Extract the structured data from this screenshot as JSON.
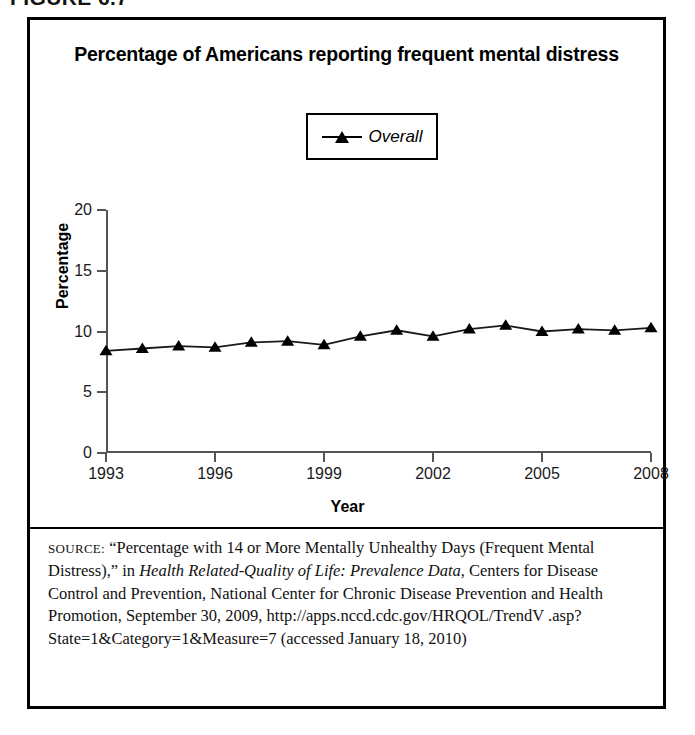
{
  "figure": {
    "label": "FIGURE 6.7"
  },
  "chart": {
    "title": "Percentage of Americans reporting frequent mental distress",
    "legend": {
      "position": "top-center",
      "entries": [
        {
          "label": "Overall",
          "marker": "triangle-up-marker",
          "color": "#000000"
        }
      ]
    }
  },
  "chart_data": {
    "type": "line",
    "title": "Percentage of Americans reporting frequent mental distress",
    "xlabel": "Year",
    "ylabel": "Percentage",
    "xlim": [
      1993,
      2008
    ],
    "ylim": [
      0,
      20
    ],
    "xticks": [
      1993,
      1996,
      1999,
      2002,
      2005,
      2008
    ],
    "yticks": [
      0,
      5,
      10,
      15,
      20
    ],
    "xtick_labels": [
      "1993",
      "1996",
      "1999",
      "2002",
      "2005",
      "2008"
    ],
    "ytick_labels": [
      "0",
      "5",
      "10",
      "15",
      "20"
    ],
    "grid": false,
    "legend_position": "top-center",
    "x": [
      1993,
      1994,
      1995,
      1996,
      1997,
      1998,
      1999,
      2000,
      2001,
      2002,
      2003,
      2004,
      2005,
      2006,
      2007,
      2008
    ],
    "series": [
      {
        "name": "Overall",
        "color": "#000000",
        "marker": "triangle-up-marker",
        "values": [
          8.4,
          8.6,
          8.8,
          8.7,
          9.1,
          9.2,
          8.9,
          9.6,
          10.1,
          9.6,
          10.2,
          10.5,
          10.0,
          10.2,
          10.1,
          10.3
        ]
      }
    ]
  },
  "source": {
    "caps_prefix": "SOURCE:",
    "line1_a": " “Percentage with 14 or More Mentally Unhealthy Days",
    "line2_a": "(Frequent Mental Distress),” in ",
    "italic1": "Health Related-Quality of Life:",
    "italic2": "Prevalence Data",
    "line3_b": ", Centers for Disease Control and Prevention, National",
    "line4": "Center for Chronic Disease Prevention and Health Promotion,",
    "line5": "September 30, 2009, http://apps.nccd.cdc.gov/HRQOL/TrendV",
    "line6": ".asp?State=1&Category=1&Measure=7 (accessed January 18, 2010)"
  }
}
